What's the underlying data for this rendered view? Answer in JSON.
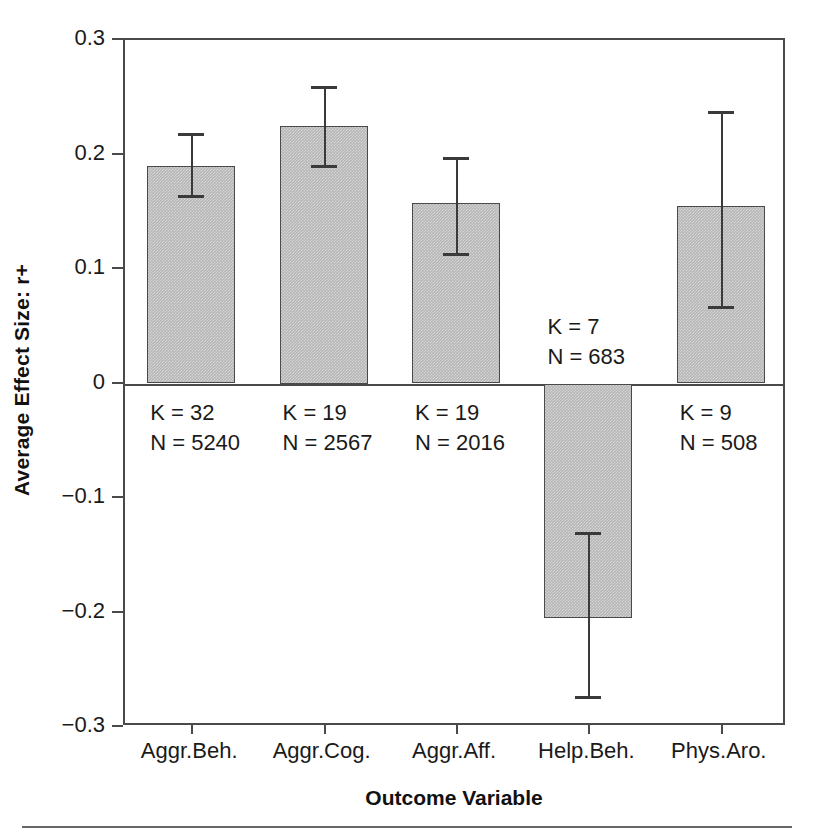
{
  "chart_data": {
    "type": "bar",
    "title": "",
    "xlabel": "Outcome Variable",
    "ylabel": "Average Effect Size: r+",
    "ylim": [
      -0.3,
      0.3
    ],
    "ytick_labels": [
      "0.3",
      "0.2",
      "0.1",
      "0",
      "−0.1",
      "−0.2",
      "−0.3"
    ],
    "ytick_values": [
      0.3,
      0.2,
      0.1,
      0,
      -0.1,
      -0.2,
      -0.3
    ],
    "grid": false,
    "legend": "none",
    "categories": [
      "Aggr.Beh.",
      "Aggr.Cog.",
      "Aggr.Aff.",
      "Help.Beh.",
      "Phys.Aro."
    ],
    "values": [
      0.19,
      0.225,
      0.158,
      -0.205,
      0.155
    ],
    "ci_upper": [
      0.219,
      0.26,
      0.198,
      -0.13,
      0.238
    ],
    "ci_lower": [
      0.165,
      0.191,
      0.114,
      -0.273,
      0.068
    ],
    "annotations": [
      {
        "k": "K = 32",
        "n": "N = 5240"
      },
      {
        "k": "K = 19",
        "n": "N = 2567"
      },
      {
        "k": "K = 19",
        "n": "N = 2016"
      },
      {
        "k": "K = 7",
        "n": "N = 683"
      },
      {
        "k": "K = 9",
        "n": "N = 508"
      }
    ],
    "colors": {
      "bar_fill": "#b6b6b6",
      "bar_edge": "#4a4a4a",
      "error_bar": "#3a3a3a",
      "axis": "#4a4a4a",
      "text": "#1a1a1a",
      "background": "#ffffff"
    }
  }
}
